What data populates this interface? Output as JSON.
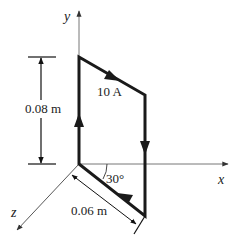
{
  "diagram": {
    "axes": {
      "x_label": "x",
      "y_label": "y",
      "z_label": "z"
    },
    "loop": {
      "current_label": "10 A",
      "height_label": "0.08 m",
      "width_label": "0.06 m",
      "angle_label": "30°"
    },
    "colors": {
      "axis": "#555555",
      "wire": "#1a1a1a",
      "text": "#222222"
    }
  }
}
